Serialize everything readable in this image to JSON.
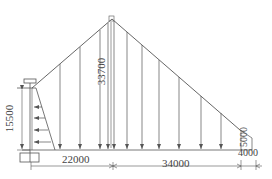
{
  "diagram": {
    "title": "",
    "line_color": "#555555",
    "dimensions": {
      "left_height": "15500",
      "peak_height": "33700",
      "right_height": "5000",
      "left_span": "22000",
      "right_span": "34000",
      "end_span": "4000"
    },
    "load_arrows": {
      "vertical_count": 13,
      "horizontal_count": 5
    }
  }
}
